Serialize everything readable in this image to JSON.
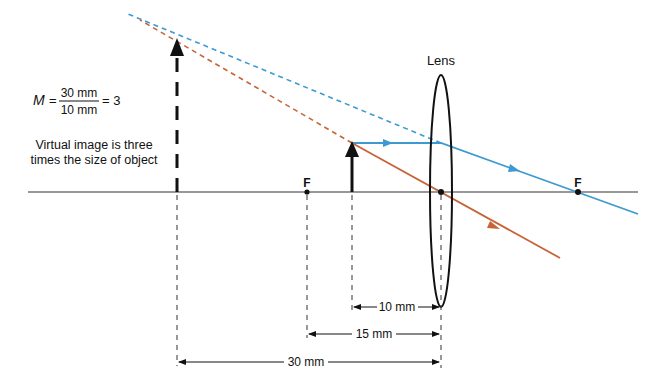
{
  "diagram": {
    "lens_label": "Lens",
    "focal_left_label": "F",
    "focal_right_label": "F",
    "formula": {
      "variable": "M",
      "equals": "=",
      "numerator": "30 mm",
      "denominator": "10 mm",
      "result": "= 3"
    },
    "caption_line1": "Virtual image is three",
    "caption_line2": "times the size of object",
    "dimensions": {
      "object_distance": "10 mm",
      "focal_length": "15 mm",
      "image_distance": "30 mm"
    },
    "colors": {
      "blue_ray": "#3d9ad1",
      "orange_ray": "#c8643a",
      "ink": "#111111"
    }
  }
}
